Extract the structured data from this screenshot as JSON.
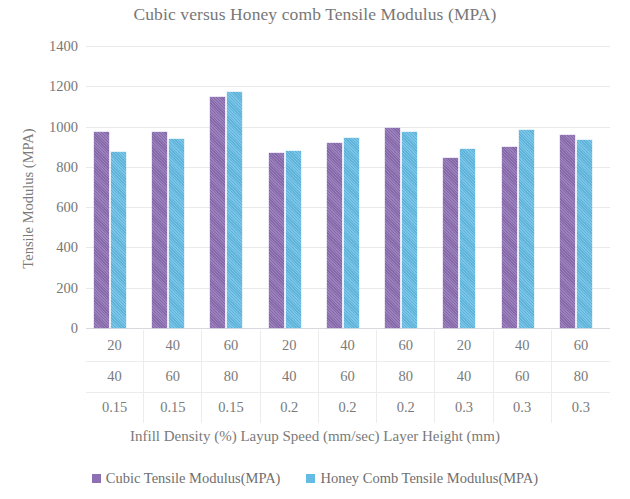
{
  "chart_data": {
    "type": "bar",
    "title": "Cubic versus Honey comb Tensile Modulus (MPA)",
    "xlabel": "Infill Density (%) Layup Speed (mm/sec) Layer Height (mm)",
    "ylabel": "Tensile Modulus (MPA)",
    "ylim": [
      0,
      1400
    ],
    "ytick_labels": [
      "1400",
      "1200",
      "1000",
      "800",
      "600",
      "400",
      "200",
      "0"
    ],
    "yticks": [
      1400,
      1200,
      1000,
      800,
      600,
      400,
      200,
      0
    ],
    "grid": true,
    "legend_position": "bottom",
    "categories": [
      "20 / 40 / 0.15",
      "40 / 60 / 0.15",
      "60 / 80 / 0.15",
      "20 / 40 / 0.2",
      "40 / 60 / 0.2",
      "60 / 80 / 0.2",
      "20 / 40 / 0.3",
      "40 / 60 / 0.3",
      "60 / 80 / 0.3"
    ],
    "category_rows": [
      {
        "name": "Infill Density (%)",
        "values": [
          "20",
          "40",
          "60",
          "20",
          "40",
          "60",
          "20",
          "40",
          "60"
        ]
      },
      {
        "name": "Layup Speed (mm/sec)",
        "values": [
          "40",
          "60",
          "80",
          "40",
          "60",
          "80",
          "40",
          "60",
          "80"
        ]
      },
      {
        "name": "Layer Height (mm)",
        "values": [
          "0.15",
          "0.15",
          "0.15",
          "0.2",
          "0.2",
          "0.2",
          "0.3",
          "0.3",
          "0.3"
        ]
      }
    ],
    "series": [
      {
        "name": "Cubic Tensile Modulus(MPA)",
        "color": "#8d6fb3",
        "values": [
          975,
          975,
          1145,
          870,
          920,
          995,
          845,
          900,
          960
        ]
      },
      {
        "name": "Honey Comb Tensile Modulus(MPA)",
        "color": "#64bce4",
        "values": [
          875,
          940,
          1170,
          880,
          945,
          975,
          890,
          985,
          935
        ]
      }
    ]
  }
}
